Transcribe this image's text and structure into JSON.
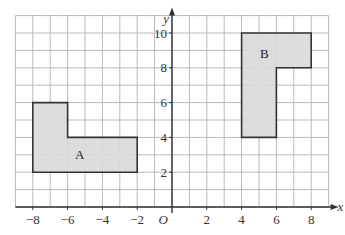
{
  "diagram": {
    "type": "coordinate-grid",
    "x_axis": {
      "label": "x",
      "min": -9,
      "max": 9,
      "ticks": [
        -8,
        -6,
        -4,
        -2,
        2,
        4,
        6,
        8
      ]
    },
    "y_axis": {
      "label": "y",
      "min": 0,
      "max": 11,
      "ticks": [
        2,
        4,
        6,
        8,
        10
      ]
    },
    "origin_label": "O",
    "colors": {
      "grid": "#b8b8b8",
      "axis": "#333333",
      "shape_fill": "#d9d9d9",
      "shape_stroke": "#333333"
    },
    "shapes": [
      {
        "label": "A",
        "vertices": [
          [
            -8,
            2
          ],
          [
            -2,
            2
          ],
          [
            -2,
            4
          ],
          [
            -6,
            4
          ],
          [
            -6,
            6
          ],
          [
            -8,
            6
          ]
        ],
        "label_pos": [
          -5.3,
          3
        ]
      },
      {
        "label": "B",
        "vertices": [
          [
            4,
            4
          ],
          [
            6,
            4
          ],
          [
            6,
            8
          ],
          [
            8,
            8
          ],
          [
            8,
            10
          ],
          [
            4,
            10
          ]
        ],
        "label_pos": [
          5.3,
          8.8
        ]
      }
    ]
  }
}
